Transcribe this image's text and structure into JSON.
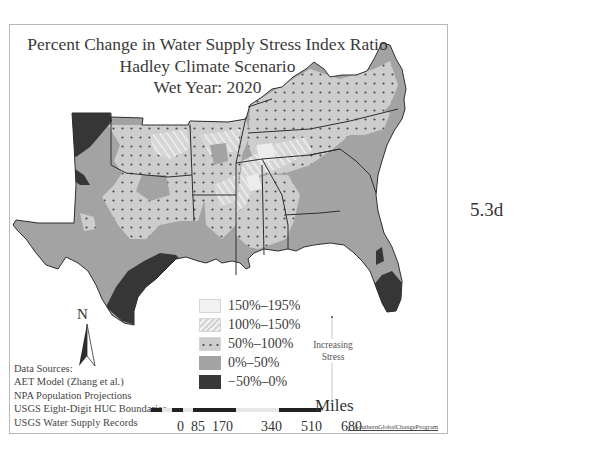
{
  "figure": {
    "label": "5.3d"
  },
  "map": {
    "title_lines": [
      "Percent Change in Water Supply Stress Index Ratio",
      "Hadley Climate Scenario",
      "Wet Year: 2020"
    ],
    "region": "Southeastern United States",
    "legend": {
      "items": [
        {
          "label": "150%–195%",
          "pattern": "plain-light",
          "color": "#ececec"
        },
        {
          "label": "100%–150%",
          "pattern": "diagonal-hatch",
          "color": "#d8d8d8"
        },
        {
          "label": "50%–100%",
          "pattern": "dots",
          "color": "#cdcdcd"
        },
        {
          "label": "0%–50%",
          "pattern": "solid",
          "color": "#a3a3a3"
        },
        {
          "label": "−50%–0%",
          "pattern": "solid",
          "color": "#3a3a3a"
        }
      ],
      "arrow_label_lines": [
        "Increasing",
        "Stress"
      ]
    },
    "north_arrow": {
      "letter": "N",
      "icon": "north-arrow-icon"
    },
    "data_sources": {
      "heading": "Data Sources:",
      "items": [
        "AET Model (Zhang et al.)",
        "NPA Population Projections",
        "USGS Eight-Digit HUC Boundaries",
        "USGS Water Supply Records"
      ]
    },
    "scale": {
      "unit": "Miles",
      "ticks": [
        "0",
        "85",
        "170",
        "340",
        "510",
        "680"
      ]
    },
    "credit": "© SouthernGlobalChangeProgram"
  }
}
